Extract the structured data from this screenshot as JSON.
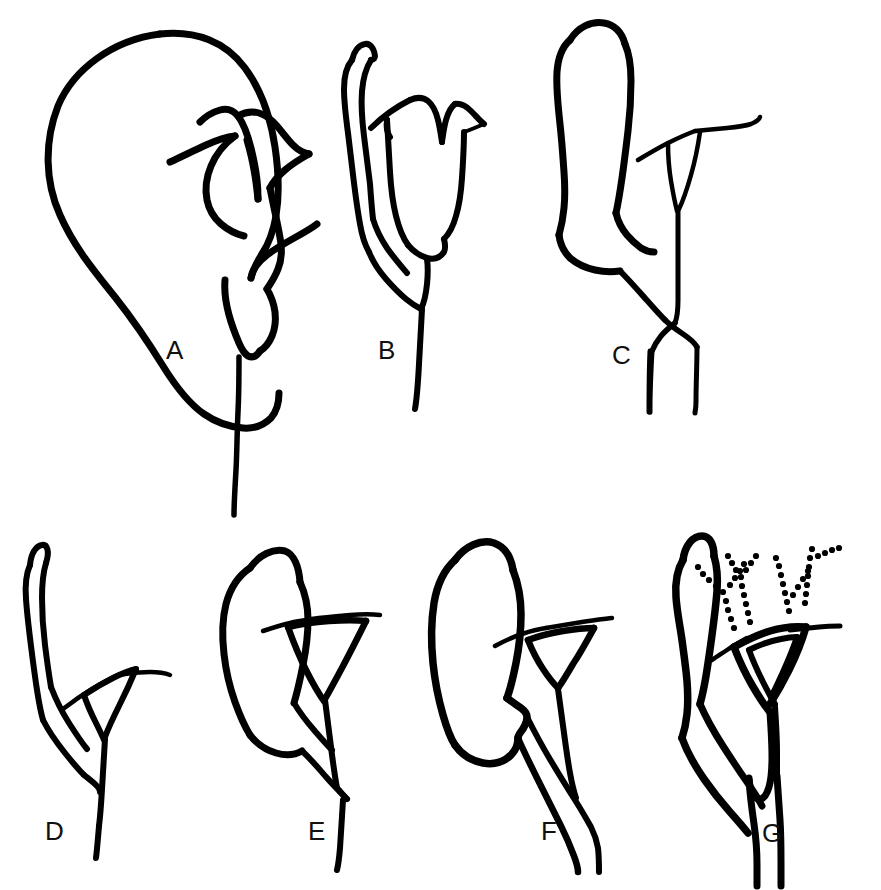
{
  "figure": {
    "kind": "line-drawing-plate",
    "background_color": "#ffffff",
    "ink_color": "#000000",
    "width": 881,
    "height": 890,
    "rows": 2,
    "columns_top": 3,
    "columns_bottom": 4,
    "panel_count": 7
  },
  "panels": [
    {
      "id": "A",
      "label": "A",
      "label_x": 172,
      "label_y": 358,
      "row": 1,
      "column": 1,
      "description": "Large rounded bulbous sac at left joined to a broad flaring bell-shaped funnel with a deep V-notch; single long slender stalk descending",
      "parts": [
        "bulbous-sac",
        "flaring-funnel",
        "v-notch",
        "single-stalk"
      ],
      "sac_shape": "large-round",
      "funnel_shape": "broad-flaring-bell",
      "stalk_count": 1,
      "has_stipple_tufts": false
    },
    {
      "id": "B",
      "label": "B",
      "label_x": 385,
      "label_y": 358,
      "row": 1,
      "column": 2,
      "description": "Narrow elongated finger-like tube at left and a tulip-shaped cup with a V-notch rim; single long stalk",
      "parts": [
        "narrow-tube",
        "cup-funnel",
        "v-notch",
        "single-stalk"
      ],
      "sac_shape": "narrow-elongate",
      "funnel_shape": "tulip-cup",
      "stalk_count": 1,
      "has_stipple_tufts": false
    },
    {
      "id": "C",
      "label": "C",
      "label_x": 619,
      "label_y": 362,
      "row": 1,
      "column": 3,
      "description": "Long thick tubular sac bent at the base; narrow elongate triangular funnel; two stalks that cross and run down in parallel",
      "parts": [
        "tubular-sac",
        "narrow-triangular-funnel",
        "crossing-stalks"
      ],
      "sac_shape": "long-tubular",
      "funnel_shape": "narrow-triangle",
      "stalk_count": 2,
      "has_stipple_tufts": false
    },
    {
      "id": "D",
      "label": "D",
      "label_x": 52,
      "label_y": 838,
      "row": 2,
      "column": 1,
      "description": "Very slender elongated tube at left; small triangular funnel with flat rim; single stalk descending",
      "parts": [
        "slender-tube",
        "triangular-funnel",
        "single-stalk"
      ],
      "sac_shape": "very-slender",
      "funnel_shape": "small-triangle",
      "stalk_count": 1,
      "has_stipple_tufts": false
    },
    {
      "id": "E",
      "label": "E",
      "label_x": 314,
      "label_y": 838,
      "row": 2,
      "column": 2,
      "description": "Broad pear-shaped sac; triangular funnel with flat rim; single stalk",
      "parts": [
        "pear-sac",
        "triangular-funnel",
        "single-stalk"
      ],
      "sac_shape": "pear",
      "funnel_shape": "triangle",
      "stalk_count": 1,
      "has_stipple_tufts": false
    },
    {
      "id": "F",
      "label": "F",
      "label_x": 548,
      "label_y": 838,
      "row": 2,
      "column": 3,
      "description": "Elongated oval sac with a kinked base; small triangular funnel; paired double-line stalk running down",
      "parts": [
        "oval-sac",
        "triangular-funnel",
        "double-stalk"
      ],
      "sac_shape": "elongate-oval",
      "funnel_shape": "small-triangle",
      "stalk_count": 2,
      "has_stipple_tufts": false
    },
    {
      "id": "G",
      "label": "G",
      "label_x": 768,
      "label_y": 840,
      "row": 2,
      "column": 4,
      "description": "Slender wavy tube at left; thick-walled triangular funnel with flat rim; four stippled branching tufts of dots above the rim; thick double-walled stalk",
      "parts": [
        "wavy-tube",
        "thick-walled-funnel",
        "stipple-tufts",
        "double-walled-stalk"
      ],
      "sac_shape": "slender-wavy",
      "funnel_shape": "thick-walled-triangle",
      "stalk_count": 2,
      "has_stipple_tufts": true,
      "stipple_tuft_count": 4,
      "stipple_dot_radius": 3.1
    }
  ],
  "labels": {
    "a": "A",
    "b": "B",
    "c": "C",
    "d": "D",
    "e": "E",
    "f": "F",
    "g": "G"
  },
  "style": {
    "label_font_size_px": 26,
    "outline_stroke_width_px": 6,
    "thin_stroke_width_px": 4
  }
}
